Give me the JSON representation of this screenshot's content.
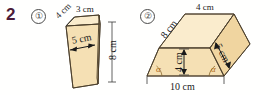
{
  "exercise": {
    "number": "2"
  },
  "items": [
    {
      "marker": "①",
      "name": "oblique-prism",
      "labels": {
        "top_left_edge": "4 cm",
        "top_edge": "3 cm",
        "front_width": "5 cm",
        "right_height": "8 cm"
      }
    },
    {
      "marker": "②",
      "name": "trapezoidal-prism",
      "labels": {
        "slant_left": "8 cm",
        "top_edge": "4 cm",
        "depth_right": "5 cm",
        "height": "4 cm",
        "base_edge": "10 cm",
        "angle_left": "α",
        "angle_right": "α"
      }
    }
  ],
  "colors": {
    "number_accent": "#4c1b39",
    "face_light": "#faeccd",
    "face_mid": "#f5e0b4",
    "face_dark": "#f0d5a0",
    "outline": "#4a3d2a",
    "angle_label": "#b06a16",
    "background": "#ffffff"
  }
}
